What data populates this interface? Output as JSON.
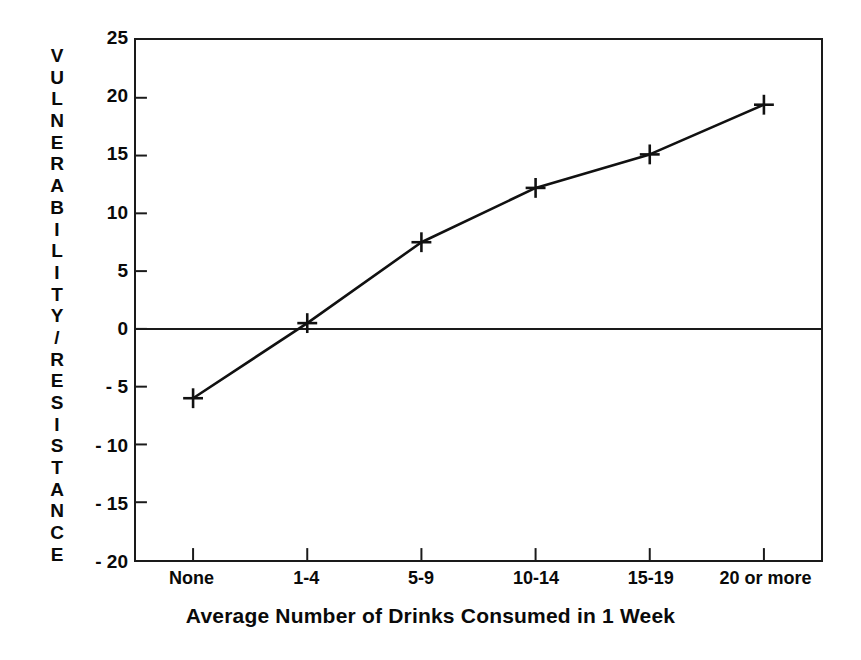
{
  "chart_data": {
    "type": "line",
    "title": "",
    "xlabel": "Average Number of Drinks Consumed in 1 Week",
    "ylabel": "VULNERABILITY/RESISTANCE",
    "categories": [
      "None",
      "1-4",
      "5-9",
      "10-14",
      "15-19",
      "20 or more"
    ],
    "values": [
      -6,
      0.5,
      7.5,
      12.2,
      15.1,
      19.4
    ],
    "series": [
      {
        "name": "Vulnerability/Resistance",
        "values": [
          -6,
          0.5,
          7.5,
          12.2,
          15.1,
          19.4
        ]
      }
    ],
    "ylim": [
      -20,
      25
    ],
    "yticks": [
      25,
      20,
      15,
      10,
      5,
      0,
      -5,
      -10,
      -15,
      -20
    ],
    "ytick_labels": [
      "25",
      "20",
      "15",
      "10",
      "5",
      "0",
      "- 5",
      "- 10",
      "- 15",
      "- 20"
    ],
    "grid": false,
    "legend": "none",
    "marker": "plus",
    "zero_line": true,
    "line_color": "#111111",
    "axis_color": "#1a1a1a",
    "background_color": "#ffffff"
  },
  "ylabel_letters": [
    "V",
    "U",
    "L",
    "N",
    "E",
    "R",
    "A",
    "B",
    "I",
    "L",
    "I",
    "T",
    "Y",
    "/",
    "R",
    "E",
    "S",
    "I",
    "S",
    "T",
    "A",
    "N",
    "C",
    "E"
  ]
}
